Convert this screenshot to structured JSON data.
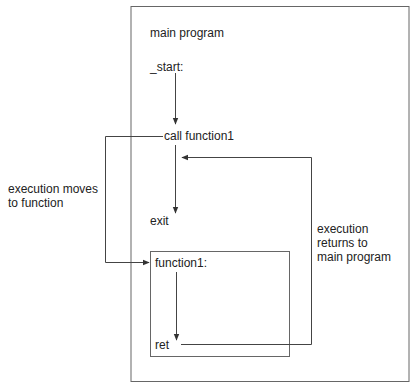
{
  "diagram": {
    "main_box": {
      "title": "main program"
    },
    "labels": {
      "start": "_start:",
      "call": "call function1",
      "exit": "exit",
      "function_label": "function1:",
      "ret": "ret"
    },
    "annotations": {
      "moves": "execution moves\nto function",
      "returns": "execution\nreturns to\nmain program"
    },
    "colors": {
      "line": "#555555",
      "text": "#222222",
      "background": "#ffffff"
    }
  }
}
